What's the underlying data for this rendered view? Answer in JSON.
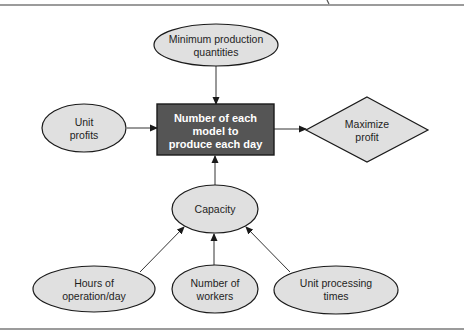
{
  "diagram": {
    "nodes": {
      "minimum_production": {
        "line1": "Minimum production",
        "line2": "quantities",
        "shape": "ellipse"
      },
      "unit_profits": {
        "line1": "Unit",
        "line2": "profits",
        "shape": "ellipse"
      },
      "decision": {
        "line1": "Number of each",
        "line2": "model to",
        "line3": "produce each day",
        "shape": "rectangle"
      },
      "objective": {
        "line1": "Maximize",
        "line2": "profit",
        "shape": "diamond"
      },
      "capacity": {
        "line1": "Capacity",
        "shape": "ellipse"
      },
      "hours": {
        "line1": "Hours of",
        "line2": "operation/day",
        "shape": "ellipse"
      },
      "workers": {
        "line1": "Number of",
        "line2": "workers",
        "shape": "ellipse"
      },
      "processing": {
        "line1": "Unit processing",
        "line2": "times",
        "shape": "ellipse"
      }
    },
    "edges": [
      {
        "from": "minimum_production",
        "to": "decision"
      },
      {
        "from": "unit_profits",
        "to": "decision"
      },
      {
        "from": "decision",
        "to": "objective"
      },
      {
        "from": "capacity",
        "to": "decision"
      },
      {
        "from": "hours",
        "to": "capacity"
      },
      {
        "from": "workers",
        "to": "capacity"
      },
      {
        "from": "processing",
        "to": "capacity"
      }
    ],
    "colors": {
      "node_fill": "#e0e0e0",
      "decision_fill": "#555555",
      "decision_text": "#ffffff",
      "stroke": "#1a1a1a"
    }
  }
}
